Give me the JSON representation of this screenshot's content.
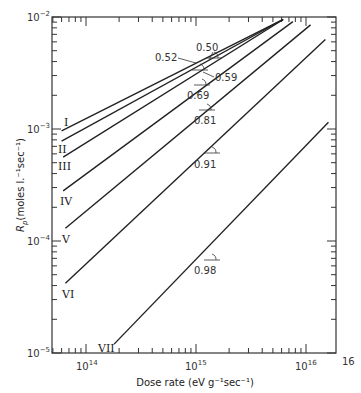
{
  "chart_data": {
    "type": "line",
    "title": "",
    "xlabel": "Dose rate (eV g⁻¹sec⁻¹)",
    "ylabel": "Rp(moles l.⁻¹sec⁻¹)",
    "xscale": "log",
    "yscale": "log",
    "xlim": [
      50000000000000.0,
      1.6e+16
    ],
    "ylim": [
      1e-05,
      0.01
    ],
    "x_ticks": [
      "10^14",
      "10^15",
      "10^16"
    ],
    "x_tick_extra": "16",
    "y_ticks": [
      "10^-2",
      "10^-3",
      "10^-4",
      "10^-5"
    ],
    "grid": false,
    "series": [
      {
        "name": "I",
        "x": [
          60000000000000.0,
          6200000000000000.0
        ],
        "y": [
          0.00096,
          0.0095
        ],
        "slope": 0.5
      },
      {
        "name": "II",
        "x": [
          60000000000000.0,
          6200000000000000.0
        ],
        "y": [
          0.00078,
          0.0095
        ],
        "slope": 0.52
      },
      {
        "name": "III",
        "x": [
          62000000000000.0,
          6200000000000000.0
        ],
        "y": [
          0.00056,
          0.0095
        ],
        "slope": 0.59
      },
      {
        "name": "IV",
        "x": [
          62000000000000.0,
          7600000000000000.0
        ],
        "y": [
          0.00028,
          0.0091
        ],
        "slope": 0.69
      },
      {
        "name": "V",
        "x": [
          65000000000000.0,
          1.1e+16
        ],
        "y": [
          0.00013,
          0.0085
        ],
        "slope": 0.81
      },
      {
        "name": "VI",
        "x": [
          65000000000000.0,
          1.5e+16
        ],
        "y": [
          4.2e-05,
          0.0063
        ],
        "slope": 0.91
      },
      {
        "name": "VII",
        "x": [
          180000000000000.0,
          1.6e+16
        ],
        "y": [
          1.2e-05,
          0.00115
        ],
        "slope": 0.98
      }
    ],
    "annotations": [
      "0.50",
      "0.52",
      "0.59",
      "0.69",
      "0.81",
      "0.91",
      "0.98"
    ]
  },
  "labels": {
    "xlabel": "Dose rate (eV g⁻¹sec⁻¹)",
    "ylabel_main": "R",
    "ylabel_sub": "p",
    "ylabel_rest": "(moles l.⁻¹sec⁻¹)",
    "x16_extra": "16"
  }
}
